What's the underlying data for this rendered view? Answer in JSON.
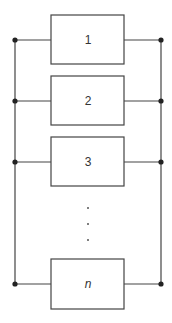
{
  "diagram": {
    "type": "parallel-system",
    "blocks": [
      {
        "label": "1",
        "italic": false
      },
      {
        "label": "2",
        "italic": false
      },
      {
        "label": "3",
        "italic": false
      },
      {
        "label": "n",
        "italic": true
      }
    ],
    "ellipsis": "· · ·",
    "colors": {
      "line": "#333333",
      "node": "#222222",
      "background": "#ffffff"
    }
  }
}
